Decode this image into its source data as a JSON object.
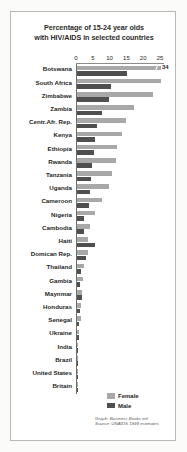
{
  "chart_data": {
    "type": "bar",
    "orientation": "horizontal",
    "title": "Percentage of 15-24 year olds with HIV/AIDS in selected countries",
    "title_lines": [
      "Percentage of 15-24 year olds",
      "with HIV/AIDS in selected countries"
    ],
    "xlabel": "",
    "ylabel": "",
    "xlim": [
      0,
      25
    ],
    "xticks": [
      0,
      5,
      10,
      15,
      20,
      25
    ],
    "xtick_labels": [
      "0",
      "5",
      "10",
      "15",
      "20",
      "25"
    ],
    "grid": false,
    "legend_position": "bottom-right",
    "axis_break_note": "34",
    "categories": [
      "Botswana",
      "South Africa",
      "Zimbabwe",
      "Zambia",
      "Centr.Afr. Rep.",
      "Kenya",
      "Ethiopia",
      "Rwanda",
      "Tanzania",
      "Uganda",
      "Cameroon",
      "Nigeria",
      "Cambodia",
      "Haiti",
      "Domican Rep.",
      "Thailand",
      "Gambia",
      "Maynmar",
      "Honduras",
      "Senegal",
      "Ukraine",
      "India",
      "Brazil",
      "United States",
      "Britain"
    ],
    "series": [
      {
        "name": "Female",
        "color": "#a8a8a8",
        "values": [
          34,
          25,
          22.5,
          17,
          14.5,
          13.5,
          12,
          11.5,
          10.5,
          9.5,
          7.5,
          5.5,
          4,
          3.4,
          3.2,
          2.2,
          1.9,
          1.6,
          1.3,
          1.1,
          0.5,
          0.3,
          0.25,
          0.2,
          0.15
        ]
      },
      {
        "name": "Male",
        "color": "#4f4f4f",
        "values": [
          15,
          10,
          9.5,
          7.5,
          6,
          5.5,
          5,
          4.5,
          4.2,
          4,
          3.5,
          2.2,
          2,
          5.5,
          2.6,
          1.2,
          1,
          1.4,
          1,
          0.6,
          0.5,
          0.35,
          0.3,
          0.25,
          0.2
        ]
      }
    ],
    "annotations": [
      {
        "category": "Botswana",
        "series": "Female",
        "text": "34"
      }
    ]
  },
  "legend": {
    "items": [
      {
        "label": "Female",
        "color": "#a8a8a8"
      },
      {
        "label": "Male",
        "color": "#4f4f4f"
      }
    ]
  },
  "credit": {
    "lines": [
      "Graph: Business Books intl",
      "Source: UNAIDS 1999 estimates"
    ]
  }
}
